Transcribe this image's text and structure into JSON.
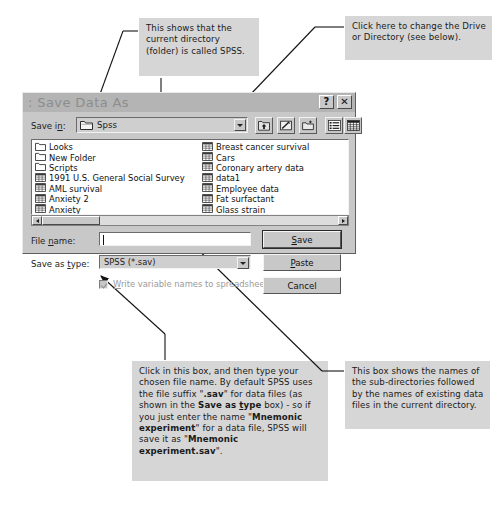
{
  "dialog": {
    "title": ": Save Data As",
    "help_button": "?",
    "close_button": "✕",
    "save_in_label": "Save in:",
    "save_in_value": "Spss",
    "toolbar": [
      {
        "name": "up-one-level-icon",
        "tip": "Up One Level"
      },
      {
        "name": "favorites-icon",
        "tip": "Look in Favorites"
      },
      {
        "name": "create-new-folder-icon",
        "tip": "Create New Folder"
      },
      {
        "name": "list-view-icon",
        "tip": "List"
      },
      {
        "name": "details-view-icon",
        "tip": "Details"
      }
    ],
    "file_list": {
      "column1": [
        {
          "name": "Looks",
          "type": "folder"
        },
        {
          "name": "New Folder",
          "type": "folder"
        },
        {
          "name": "Scripts",
          "type": "folder"
        },
        {
          "name": "1991 U.S. General Social Survey",
          "type": "sav"
        },
        {
          "name": "AML survival",
          "type": "sav"
        },
        {
          "name": "Anxiety 2",
          "type": "sav"
        },
        {
          "name": "Anxiety",
          "type": "sav"
        }
      ],
      "column2": [
        {
          "name": "Breast cancer survival",
          "type": "sav"
        },
        {
          "name": "Cars",
          "type": "sav"
        },
        {
          "name": "Coronary artery data",
          "type": "sav"
        },
        {
          "name": "data1",
          "type": "sav"
        },
        {
          "name": "Employee data",
          "type": "sav"
        },
        {
          "name": "Fat surfactant",
          "type": "sav"
        },
        {
          "name": "Glass strain",
          "type": "sav"
        }
      ]
    },
    "file_name_label": "File name:",
    "file_name_value": "",
    "save_as_type_label": "Save as type:",
    "save_as_type_value": "SPSS (*.sav)",
    "write_var_names_label": "Write variable names to spreadsheet",
    "write_var_names_checked": true,
    "buttons": {
      "save": "Save",
      "paste": "Paste",
      "cancel": "Cancel"
    }
  },
  "annotations": {
    "top_left": "This shows that the current directory (folder) is called SPSS.",
    "top_right": "Click here to change the Drive or Directory (see below).",
    "bottom_right": "This box shows the names of the sub-directories followed by the names of existing data files in the current directory."
  },
  "colors": {
    "callout_bg": "#d6d6d6",
    "dialog_face": "#c8c8c8",
    "titlebar": "#b4b4b4",
    "field_bg": "#ffffff"
  }
}
